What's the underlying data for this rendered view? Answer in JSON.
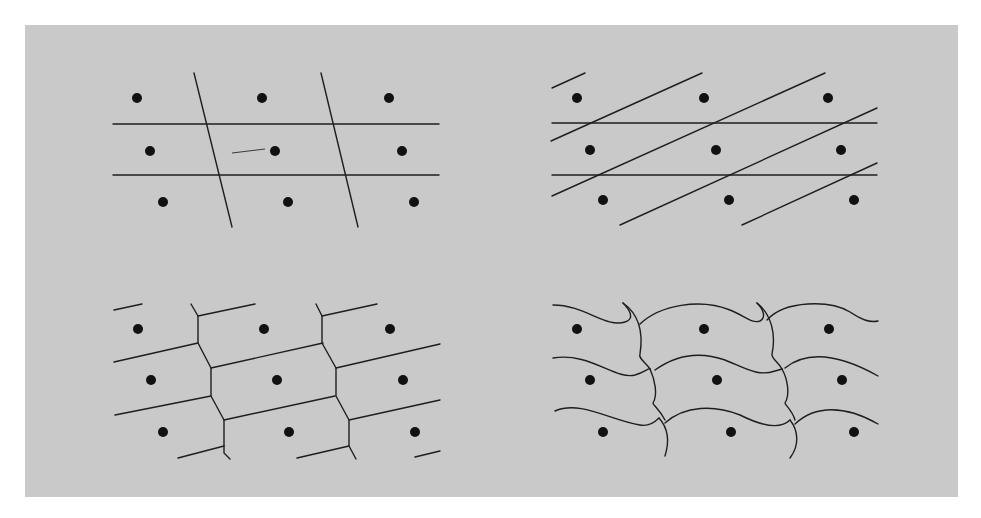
{
  "figure": {
    "background_color": "#c9c9c9",
    "line_color": "#1e1e1e",
    "dot_color": "#111111",
    "panels": [
      {
        "id": "top-left",
        "tiling": "parallelogram cells (horizontal + steep slanted lines)",
        "dots": [
          [
            137,
            98
          ],
          [
            262,
            98
          ],
          [
            389,
            98
          ],
          [
            150,
            151
          ],
          [
            275,
            151
          ],
          [
            402,
            151
          ],
          [
            163,
            202
          ],
          [
            288,
            202
          ],
          [
            414,
            202
          ]
        ],
        "lines": [
          [
            113,
            124,
            439,
            124
          ],
          [
            113,
            175,
            439,
            175
          ],
          [
            194,
            73,
            232,
            227
          ],
          [
            321,
            73,
            358,
            227
          ]
        ],
        "thin_lines": [
          [
            232,
            153,
            265,
            149
          ]
        ]
      },
      {
        "id": "top-right",
        "tiling": "parallelogram cells (horizontal + shallow slanted lines)",
        "dots": [
          [
            577,
            98
          ],
          [
            704,
            98
          ],
          [
            828,
            98
          ],
          [
            590,
            150
          ],
          [
            716,
            150
          ],
          [
            841,
            150
          ],
          [
            603,
            200
          ],
          [
            729,
            200
          ],
          [
            854,
            200
          ]
        ],
        "lines": [
          [
            552,
            123,
            877,
            123
          ],
          [
            552,
            175,
            877,
            175
          ],
          [
            552,
            88,
            585,
            73
          ],
          [
            551,
            141,
            702,
            73
          ],
          [
            552,
            196,
            825,
            73
          ],
          [
            620,
            225,
            877,
            108
          ],
          [
            742,
            225,
            877,
            163
          ]
        ],
        "thin_lines": []
      },
      {
        "id": "bottom-left",
        "tiling": "hexagonal cells (Voronoi / Dirichlet domains)",
        "dots": [
          [
            138,
            329
          ],
          [
            264,
            329
          ],
          [
            390,
            329
          ],
          [
            151,
            380
          ],
          [
            277,
            380
          ],
          [
            403,
            380
          ],
          [
            163,
            432
          ],
          [
            289,
            432
          ],
          [
            415,
            432
          ]
        ],
        "polylines": [
          [
            [
              191,
              304
            ],
            [
              198,
              316
            ],
            [
              198,
              343
            ],
            [
              211,
              368
            ],
            [
              211,
              396
            ],
            [
              224,
              420
            ],
            [
              224,
              453
            ],
            [
              230,
              459
            ]
          ],
          [
            [
              316,
              304
            ],
            [
              322,
              316
            ],
            [
              322,
              343
            ],
            [
              336,
              368
            ],
            [
              336,
              396
            ],
            [
              349,
              420
            ],
            [
              349,
              446
            ],
            [
              356,
              459
            ]
          ]
        ],
        "lines": [
          [
            114,
            310,
            142,
            304
          ],
          [
            198,
            316,
            255,
            304
          ],
          [
            114,
            362,
            198,
            343
          ],
          [
            211,
            368,
            323,
            343
          ],
          [
            115,
            415,
            211,
            396
          ],
          [
            224,
            420,
            335,
            396
          ],
          [
            178,
            458,
            224,
            446
          ],
          [
            322,
            316,
            377,
            304
          ],
          [
            336,
            368,
            440,
            344
          ],
          [
            349,
            420,
            440,
            400
          ],
          [
            297,
            458,
            349,
            446
          ],
          [
            415,
            457,
            440,
            451
          ]
        ]
      },
      {
        "id": "bottom-right",
        "tiling": "curved (deformed) cells",
        "dots": [
          [
            577,
            329
          ],
          [
            704,
            329
          ],
          [
            829,
            329
          ],
          [
            590,
            380
          ],
          [
            717,
            380
          ],
          [
            842,
            380
          ],
          [
            603,
            432
          ],
          [
            731,
            432
          ],
          [
            854,
            432
          ]
        ],
        "paths": [
          "M553,305 C585,305 605,328 625,322 C635,319 630,310 623,303",
          "M623,303 C640,315 643,335 640,354 C638,358 645,362 650,369",
          "M640,324 C660,305 700,298 730,310 C745,316 752,324 760,321 C766,318 764,310 757,303",
          "M757,303 C772,315 776,335 772,354 C771,358 778,362 782,369",
          "M767,320 C785,300 830,300 850,312 C862,320 870,323 878,321",
          "M553,358 C590,352 615,380 635,375 C645,372 648,368 650,369",
          "M650,369 C655,380 658,395 653,403 C653,405 660,410 665,420",
          "M655,370 C680,352 705,353 725,360 C745,368 758,377 775,371 C779,370 782,369 782,369",
          "M782,369 C788,380 790,395 785,403 C785,405 792,410 795,420",
          "M785,368 C805,352 835,352 878,376",
          "M555,411 C580,400 610,420 640,425 C650,427 657,420 659,418",
          "M659,418 C668,428 670,440 665,456",
          "M665,423 C685,405 715,405 740,415 C760,425 780,430 790,420",
          "M790,420 C798,430 800,445 790,458",
          "M795,424 C815,405 845,405 878,424"
        ]
      }
    ]
  }
}
